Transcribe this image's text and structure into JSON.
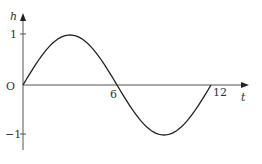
{
  "chart_data": {
    "type": "line",
    "title": "",
    "xlabel": "t",
    "ylabel": "h",
    "origin_label": "O",
    "x_ticks": [
      6,
      12
    ],
    "x_tick_labels": [
      "6",
      "12"
    ],
    "y_ticks": [
      1,
      -1
    ],
    "y_tick_labels": [
      "1",
      "−1"
    ],
    "xlim": [
      0,
      13.5
    ],
    "ylim": [
      -1.3,
      1.5
    ],
    "grid": false,
    "legend": null,
    "series": [
      {
        "name": "h = sin(πt/6)",
        "x": [
          0,
          1,
          2,
          3,
          4,
          5,
          6,
          7,
          8,
          9,
          10,
          11,
          12
        ],
        "y": [
          0,
          0.5,
          0.866,
          1,
          0.866,
          0.5,
          0,
          -0.5,
          -0.866,
          -1,
          -0.866,
          -0.5,
          0
        ]
      }
    ]
  }
}
